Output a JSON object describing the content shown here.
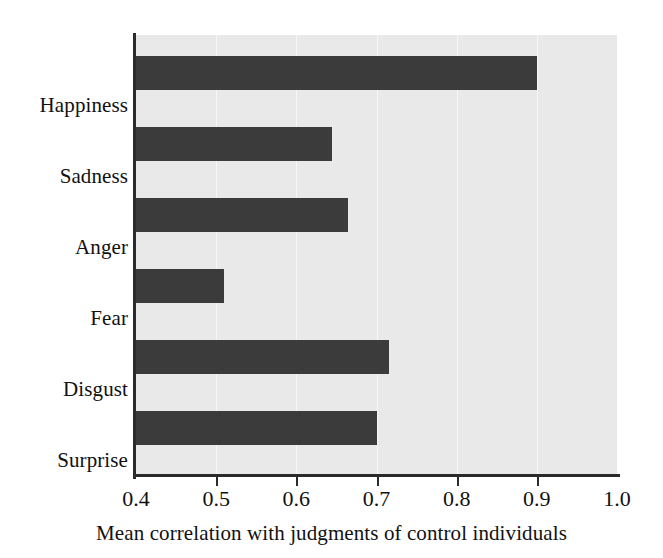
{
  "chart_data": {
    "type": "bar",
    "orientation": "horizontal",
    "title": "",
    "xlabel": "Mean correlation with judgments of control individuals",
    "ylabel": "",
    "categories": [
      "Happiness",
      "Sadness",
      "Anger",
      "Fear",
      "Disgust",
      "Surprise"
    ],
    "values": [
      0.9,
      0.645,
      0.665,
      0.51,
      0.715,
      0.7
    ],
    "xlim": [
      0.4,
      1.0
    ],
    "xticks": [
      0.4,
      0.5,
      0.6,
      0.7,
      0.8,
      0.9,
      1.0
    ],
    "xtick_labels": [
      "0.4",
      "0.5",
      "0.6",
      "0.7",
      "0.8",
      "0.9",
      "1.0"
    ],
    "grid": "vertical-light",
    "legend": "none",
    "series": [
      {
        "name": "Mean correlation",
        "values": [
          0.9,
          0.645,
          0.665,
          0.51,
          0.715,
          0.7
        ]
      }
    ]
  },
  "style": {
    "bar_color": "#3b3b3b",
    "plot_background": "#e9e9e9",
    "gridline_color": "#f6f6f6",
    "axis_color": "#2b2b2b",
    "text_color": "#111111",
    "page_background": "#ffffff"
  }
}
